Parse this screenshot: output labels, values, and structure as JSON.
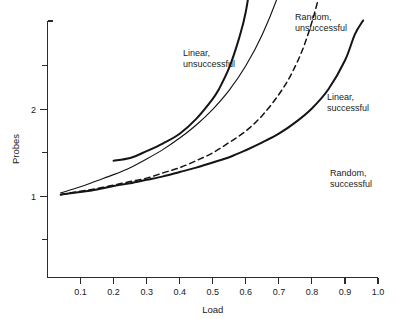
{
  "chart_data": {
    "type": "line",
    "title": "",
    "subtitle": "",
    "xlabel": "Load",
    "ylabel": "Probes",
    "xlim": [
      0.0,
      1.0
    ],
    "ylim": [
      0.45,
      5.75
    ],
    "grid": false,
    "legend_position": "inline-annotations",
    "x_ticks": [
      "0.1",
      "0.2",
      "0.3",
      "0.4",
      "0.5",
      "0.6",
      "0.7",
      "0.8",
      "0.9",
      "1.0"
    ],
    "x_tick_values": [
      0.1,
      0.2,
      0.3,
      0.4,
      0.5,
      0.6,
      0.7,
      0.8,
      0.9,
      1.0
    ],
    "y_ticks": [
      "1",
      "2",
      "3",
      "4",
      "5"
    ],
    "y_tick_values": [
      1,
      2,
      3,
      4,
      5
    ],
    "y_minor_tick_values": [
      0.5,
      1.5,
      2.5,
      3.5,
      4.5,
      5.5
    ],
    "series": [
      {
        "name": "Linear, unsuccessful",
        "style": "solid-thick",
        "x": [
          0.2,
          0.25,
          0.3,
          0.35,
          0.4,
          0.45,
          0.5,
          0.52,
          0.55,
          0.58,
          0.6,
          0.62,
          0.63,
          0.64,
          0.645
        ],
        "values": [
          1.41,
          1.44,
          1.52,
          1.61,
          1.72,
          1.89,
          2.12,
          2.24,
          2.48,
          2.82,
          3.12,
          3.62,
          3.98,
          4.6,
          5.75
        ]
      },
      {
        "name": "Random, unsuccessful",
        "style": "solid-thin",
        "x": [
          0.04,
          0.1,
          0.15,
          0.2,
          0.25,
          0.3,
          0.35,
          0.4,
          0.45,
          0.5,
          0.55,
          0.6,
          0.65,
          0.7,
          0.74,
          0.77,
          0.79,
          0.805,
          0.815,
          0.82
        ],
        "values": [
          1.04,
          1.11,
          1.18,
          1.25,
          1.33,
          1.43,
          1.54,
          1.67,
          1.82,
          2.0,
          2.22,
          2.5,
          2.86,
          3.33,
          3.85,
          4.35,
          4.76,
          5.13,
          5.45,
          5.75
        ]
      },
      {
        "name": "Linear, successful",
        "style": "dashed",
        "x": [
          0.04,
          0.1,
          0.15,
          0.2,
          0.25,
          0.3,
          0.35,
          0.4,
          0.45,
          0.5,
          0.55,
          0.6,
          0.65,
          0.7,
          0.74,
          0.78,
          0.82,
          0.85,
          0.87,
          0.885
        ],
        "values": [
          1.02,
          1.06,
          1.09,
          1.13,
          1.17,
          1.21,
          1.27,
          1.33,
          1.41,
          1.5,
          1.62,
          1.75,
          1.93,
          2.17,
          2.42,
          2.77,
          3.28,
          3.89,
          4.46,
          4.98
        ]
      },
      {
        "name": "Random, successful",
        "style": "solid-thick",
        "x": [
          0.04,
          0.1,
          0.15,
          0.2,
          0.25,
          0.3,
          0.35,
          0.4,
          0.45,
          0.5,
          0.55,
          0.6,
          0.65,
          0.7,
          0.75,
          0.8,
          0.85,
          0.9,
          0.93,
          0.955
        ],
        "values": [
          1.02,
          1.05,
          1.08,
          1.12,
          1.15,
          1.19,
          1.23,
          1.28,
          1.33,
          1.39,
          1.45,
          1.53,
          1.62,
          1.72,
          1.85,
          2.01,
          2.23,
          2.56,
          2.86,
          3.02
        ]
      }
    ],
    "annotations": [
      {
        "name": "linear-unsuccessful",
        "line1": "Linear,",
        "line2": "unsuccessful",
        "x_px": 183,
        "y_px": 56
      },
      {
        "name": "random-unsuccessful",
        "line1": "Random,",
        "line2": "unsuccessful",
        "x_px": 295,
        "y_px": 20
      },
      {
        "name": "linear-successful",
        "line1": "Linear,",
        "line2": "successful",
        "x_px": 327,
        "y_px": 100
      },
      {
        "name": "random-successful",
        "line1": "Random,",
        "line2": "successful",
        "x_px": 330,
        "y_px": 176
      }
    ]
  }
}
